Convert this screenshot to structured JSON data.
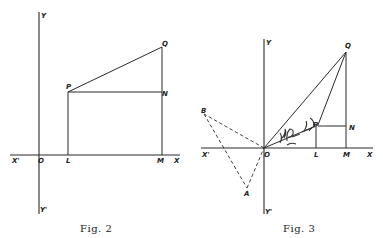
{
  "figures": [
    {
      "caption": "Fig. 2",
      "labels": {
        "Y": "Y",
        "Y_prime": "Y'",
        "X": "X",
        "X_prime": "X'",
        "O": "O",
        "P": "P",
        "Q": "Q",
        "N": "N",
        "L": "L",
        "M": "M"
      }
    },
    {
      "caption": "Fig. 3",
      "labels": {
        "Y": "Y",
        "Y_prime": "Y'",
        "X": "X",
        "X_prime": "X'",
        "O": "O",
        "P": "P",
        "Q": "Q",
        "N": "N",
        "L": "L",
        "M": "M",
        "A": "A",
        "B": "B"
      }
    }
  ]
}
